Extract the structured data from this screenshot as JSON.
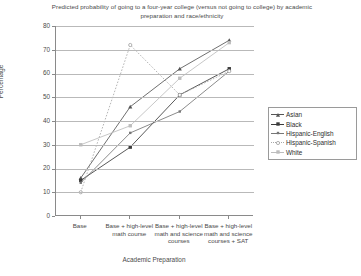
{
  "chart_data": {
    "type": "line",
    "title": "Predicted probability of going to a four-year college (versus not going to college) by academic preparation and race/ethnicity",
    "xlabel": "Academic Preparation",
    "ylabel": "Percentage",
    "ylim": [
      0,
      80
    ],
    "yticks": [
      0,
      10,
      20,
      30,
      40,
      50,
      60,
      70,
      80
    ],
    "grid": true,
    "legend_position": "right",
    "categories": [
      "Base",
      "Base + high-level math course",
      "Base + high-level math and science courses",
      "Base + high-level math and science courses + SAT"
    ],
    "series": [
      {
        "name": "Asian",
        "values": [
          16,
          46,
          62,
          74
        ],
        "color": "#555555",
        "marker": "triangle",
        "dash": "solid"
      },
      {
        "name": "Black",
        "values": [
          15,
          29,
          51,
          62
        ],
        "color": "#3a3a3a",
        "marker": "square",
        "dash": "solid"
      },
      {
        "name": "Hispanic-English",
        "values": [
          14,
          35,
          44,
          61
        ],
        "color": "#767676",
        "marker": "dot",
        "dash": "solid"
      },
      {
        "name": "Hispanic-Spanish",
        "values": [
          10,
          72,
          51,
          61
        ],
        "color": "#a8a8a8",
        "marker": "circle",
        "dash": "dotted"
      },
      {
        "name": "White",
        "values": [
          30,
          38,
          58,
          73
        ],
        "color": "#bdbdbd",
        "marker": "square",
        "dash": "solid"
      }
    ]
  }
}
